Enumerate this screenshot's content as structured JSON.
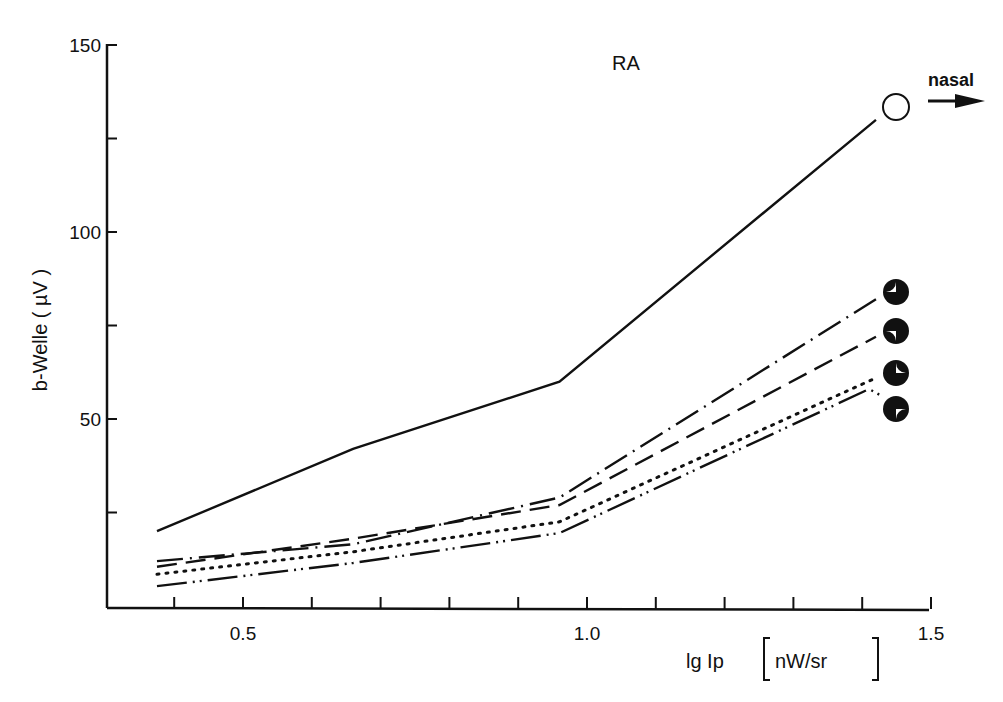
{
  "chart_data": {
    "type": "line",
    "title": "RA",
    "xlabel": "lg Ip [nW/sr]",
    "ylabel": "b-Welle (µV)",
    "xlim": [
      0.3,
      1.5
    ],
    "ylim": [
      0,
      150
    ],
    "x_ticks": [
      0.4,
      0.5,
      0.6,
      0.7,
      0.8,
      0.9,
      1.0,
      1.1,
      1.2,
      1.3,
      1.4,
      1.5
    ],
    "x_tick_labels": [
      "0.5",
      "1.0",
      "1.5"
    ],
    "y_ticks": [
      25,
      50,
      75,
      100,
      125,
      150
    ],
    "y_tick_labels": [
      "50",
      "100",
      "150"
    ],
    "grid": false,
    "legend": "marker symbols at line ends (circle quadrant glyphs)",
    "annotations": [
      {
        "text": "RA",
        "position": "top center"
      },
      {
        "text": "nasal",
        "position": "top right, with right arrow"
      }
    ],
    "series": [
      {
        "name": "open circle",
        "marker": "open-circle",
        "line_style": "solid",
        "x": [
          0.375,
          0.66,
          0.96,
          1.42
        ],
        "y": [
          20,
          42,
          60,
          130
        ]
      },
      {
        "name": "black circle, white upper-left quadrant",
        "marker": "quadrant-ul",
        "line_style": "dash-dot",
        "x": [
          0.375,
          0.66,
          0.96,
          1.42
        ],
        "y": [
          12,
          16.5,
          29,
          82
        ]
      },
      {
        "name": "black circle, white lower-left quadrant",
        "marker": "quadrant-ll",
        "line_style": "dashed",
        "x": [
          0.375,
          0.66,
          0.96,
          1.42
        ],
        "y": [
          10.5,
          18,
          27,
          72
        ]
      },
      {
        "name": "black circle, white upper-right quadrant",
        "marker": "quadrant-ur",
        "line_style": "dotted",
        "x": [
          0.375,
          0.66,
          0.96,
          1.42
        ],
        "y": [
          8.5,
          14.5,
          22.5,
          61
        ]
      },
      {
        "name": "black circle, white lower-right quadrant",
        "marker": "quadrant-lr",
        "line_style": "dash-dot-dot",
        "x": [
          0.375,
          0.66,
          0.96,
          1.41
        ],
        "y": [
          5.3,
          11.5,
          19.5,
          58
        ]
      }
    ]
  },
  "labels": {
    "title": "RA",
    "direction": "nasal",
    "xlabel_main": "lg Ip",
    "xlabel_unit": "nW/sr",
    "ylabel": "b-Welle  ( µV )"
  }
}
